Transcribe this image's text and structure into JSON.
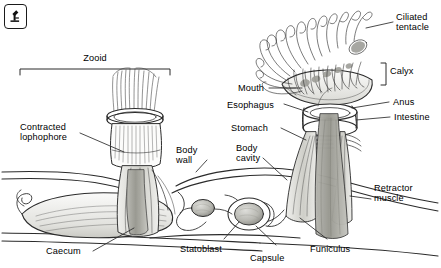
{
  "figure": {
    "badge": {
      "icon": "microscope-icon",
      "label": "d"
    },
    "title_bracket": {
      "label": "Zooid"
    },
    "calyx_bracket": {
      "label": "Calyx"
    }
  },
  "labels": {
    "ciliated_tentacle": "Ciliated\ntentacle",
    "mouth": "Mouth",
    "esophagus": "Esophagus",
    "stomach": "Stomach",
    "anus": "Anus",
    "intestine": "Intestine",
    "calyx": "Calyx",
    "zooid": "Zooid",
    "contracted_lophophore": "Contracted\nlophophore",
    "body_wall": "Body\nwall",
    "body_cavity": "Body\ncavity",
    "retractor_muscle": "Retractor\nmuscle",
    "caecum": "Caecum",
    "statoblast": "Statoblast",
    "capsule": "Capsule",
    "funiculus": "Funiculus"
  },
  "colors": {
    "ink": "#1a1a1a",
    "line": "#2b2b2b",
    "shade_light": "#e8e8e6",
    "shade_mid": "#c9c9c5",
    "shade_dark": "#9a9a95",
    "background": "#ffffff"
  }
}
